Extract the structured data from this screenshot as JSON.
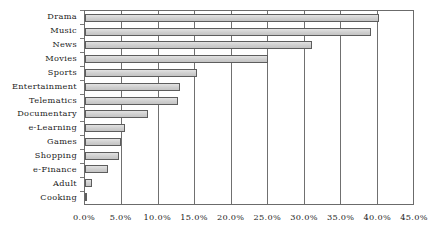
{
  "chart_data": {
    "type": "bar",
    "orientation": "horizontal",
    "title": "",
    "subtitle": "",
    "xlabel": "",
    "ylabel": "",
    "xlim": [
      0,
      45
    ],
    "ylim": null,
    "grid": true,
    "grid_axis": "x",
    "legend": false,
    "legend_position": "none",
    "value_format": "percent",
    "categories": [
      "Drama",
      "Music",
      "News",
      "Movies",
      "Sports",
      "Entertainment",
      "Telematics",
      "Documentary",
      "e-Learning",
      "Games",
      "Shopping",
      "e-Finance",
      "Adult",
      "Cooking"
    ],
    "values": [
      40.3,
      39.2,
      31.1,
      25.1,
      15.3,
      13.0,
      12.7,
      8.7,
      5.5,
      5.0,
      4.6,
      3.1,
      0.9,
      0.3
    ],
    "value_labels": [
      "40.3%",
      "39.2%",
      "31.1%",
      "25.1%",
      "15.3%",
      "13.0%",
      "12.7%",
      "8.7%",
      "5.5%",
      "5.0%",
      "4.6%",
      "3.1%",
      "0.9%",
      "0.3%"
    ],
    "xticks": [
      0,
      5,
      10,
      15,
      20,
      25,
      30,
      35,
      40,
      45
    ],
    "xticklabels": [
      "0.0%",
      "5.0%",
      "10.0%",
      "15.0%",
      "20.0%",
      "25.0%",
      "30.0%",
      "35.0%",
      "40.0%",
      "45.0%"
    ],
    "colors": {
      "bar_fill": "#d4d4d4",
      "bar_border": "#5d5d5d",
      "gridline": "#707070",
      "axis": "#6b6b6b",
      "text": "#222222",
      "background": "#ffffff"
    }
  }
}
